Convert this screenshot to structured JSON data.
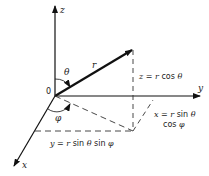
{
  "diagram": {
    "axes": {
      "z": "z",
      "y": "y",
      "x": "x"
    },
    "origin_label": "0",
    "vector_label": "r",
    "angles": {
      "theta": "θ",
      "phi": "φ"
    },
    "equations": {
      "z": {
        "lhs": "z",
        "eq": " = ",
        "r": "r",
        "rest": " cos ",
        "ang": "θ"
      },
      "x_line1": {
        "lhs": "x",
        "eq": " = ",
        "r": "r",
        "rest": " sin ",
        "ang": "θ"
      },
      "x_line2": {
        "rest": "cos ",
        "ang": "φ"
      },
      "y": {
        "lhs": "y",
        "eq": " = ",
        "r": "r",
        "rest": " sin ",
        "ang1": "θ",
        "rest2": " sin ",
        "ang2": "φ"
      }
    }
  }
}
